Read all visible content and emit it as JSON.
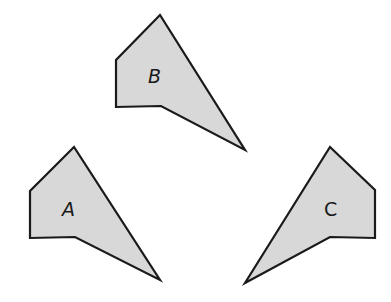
{
  "diagram": {
    "fill_color": "#d8d8d8",
    "stroke_color": "#1a1a1a",
    "shapes": [
      {
        "id": "B",
        "label": "B",
        "points": "160,15 116,60 116,107 161,106 245,150",
        "label_x": 148,
        "label_y": 83
      },
      {
        "id": "A",
        "label": "A",
        "points": "74,147 30,191 30,238 75,237 160,280",
        "label_x": 62,
        "label_y": 216
      },
      {
        "id": "C",
        "label": "C",
        "points": "330,147 375,190 375,238 330,237 245,283",
        "label_x": 324,
        "label_y": 216
      }
    ]
  }
}
